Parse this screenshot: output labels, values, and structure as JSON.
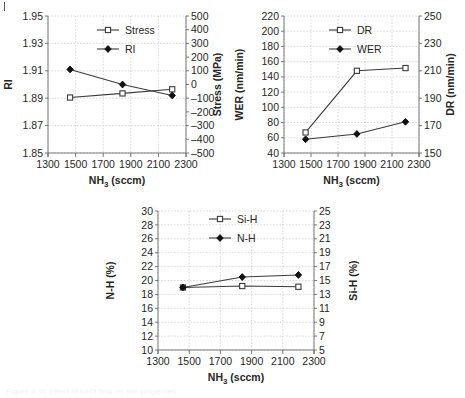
{
  "figure": {
    "corner_mark": "|",
    "caption_faint": "Figure 4.10  Effect of NH3 flow on film properties"
  },
  "shared": {
    "xlabel_main": "NH",
    "xlabel_sub": "3",
    "xlabel_unit": " (sccm)",
    "x_ticks": [
      1300,
      1500,
      1700,
      1900,
      2100,
      2300
    ],
    "xlim": [
      1300,
      2300
    ],
    "x_points": [
      1460,
      1840,
      2200
    ]
  },
  "chart_data": [
    {
      "id": "chart-ri-stress",
      "type": "line",
      "title": "",
      "xlabel": "NH3 (sccm)",
      "x": [
        1460,
        1840,
        2200
      ],
      "xlim": [
        1300,
        2300
      ],
      "xticks": [
        1300,
        1500,
        1700,
        1900,
        2100,
        2300
      ],
      "grid": true,
      "legend_position": "top-center",
      "axes": [
        {
          "side": "left",
          "ylabel": "RI",
          "ylim": [
            1.85,
            1.95
          ],
          "yticks": [
            1.85,
            1.87,
            1.89,
            1.91,
            1.93,
            1.95
          ],
          "ytick_labels": [
            "1.85",
            "1.87",
            "1.89",
            "1.91",
            "1.93",
            "1.95"
          ]
        },
        {
          "side": "right",
          "ylabel": "Stress (MPa)",
          "ylim": [
            -500,
            500
          ],
          "yticks": [
            -500,
            -400,
            -300,
            -200,
            -100,
            0,
            100,
            200,
            300,
            400,
            500
          ],
          "ytick_labels": [
            "–500",
            "–400",
            "–300",
            "–200",
            "–100",
            "0",
            "100",
            "200",
            "300",
            "400",
            "500"
          ]
        }
      ],
      "series": [
        {
          "name": "Stress",
          "axis": "right",
          "marker": "open-square",
          "values": [
            -95,
            -65,
            -35
          ]
        },
        {
          "name": "RI",
          "axis": "left",
          "marker": "filled-diamond",
          "values": [
            1.911,
            1.9,
            1.892
          ]
        }
      ]
    },
    {
      "id": "chart-wer-dr",
      "type": "line",
      "title": "",
      "xlabel": "NH3 (sccm)",
      "x": [
        1460,
        1840,
        2200
      ],
      "xlim": [
        1300,
        2300
      ],
      "xticks": [
        1300,
        1500,
        1700,
        1900,
        2100,
        2300
      ],
      "grid": true,
      "legend_position": "top-center",
      "axes": [
        {
          "side": "left",
          "ylabel": "WER (nm/min)",
          "ylim": [
            40,
            220
          ],
          "yticks": [
            40,
            60,
            80,
            100,
            120,
            140,
            160,
            180,
            200,
            220
          ],
          "ytick_labels": [
            "40",
            "60",
            "80",
            "100",
            "120",
            "140",
            "160",
            "180",
            "200",
            "220"
          ]
        },
        {
          "side": "right",
          "ylabel": "DR (nm/min)",
          "ylim": [
            150,
            250
          ],
          "yticks": [
            150,
            170,
            190,
            210,
            230,
            250
          ],
          "ytick_labels": [
            "150",
            "170",
            "190",
            "210",
            "230",
            "250"
          ]
        }
      ],
      "series": [
        {
          "name": "DR",
          "axis": "right",
          "marker": "open-square",
          "values": [
            165,
            210,
            212
          ]
        },
        {
          "name": "WER",
          "axis": "left",
          "marker": "filled-diamond",
          "values": [
            58,
            65,
            81
          ]
        }
      ]
    },
    {
      "id": "chart-nh-sih",
      "type": "line",
      "title": "",
      "xlabel": "NH3 (sccm)",
      "x": [
        1460,
        1840,
        2200
      ],
      "xlim": [
        1300,
        2300
      ],
      "xticks": [
        1300,
        1500,
        1700,
        1900,
        2100,
        2300
      ],
      "grid": true,
      "legend_position": "top-center",
      "axes": [
        {
          "side": "left",
          "ylabel": "N-H (%)",
          "ylim": [
            10,
            30
          ],
          "yticks": [
            10,
            12,
            14,
            16,
            18,
            20,
            22,
            24,
            26,
            28,
            30
          ],
          "ytick_labels": [
            "10",
            "12",
            "14",
            "16",
            "18",
            "20",
            "22",
            "24",
            "26",
            "28",
            "30"
          ]
        },
        {
          "side": "right",
          "ylabel": "Si-H (%)",
          "ylim": [
            5,
            25
          ],
          "yticks": [
            5,
            7,
            9,
            11,
            13,
            15,
            17,
            19,
            21,
            23,
            25
          ],
          "ytick_labels": [
            "5",
            "7",
            "9",
            "11",
            "13",
            "15",
            "17",
            "19",
            "21",
            "23",
            "25"
          ]
        }
      ],
      "series": [
        {
          "name": "Si-H",
          "axis": "right",
          "marker": "open-square",
          "values": [
            14.0,
            14.2,
            14.1
          ]
        },
        {
          "name": "N-H",
          "axis": "left",
          "marker": "filled-diamond",
          "values": [
            19.0,
            20.5,
            20.8
          ]
        }
      ]
    }
  ]
}
